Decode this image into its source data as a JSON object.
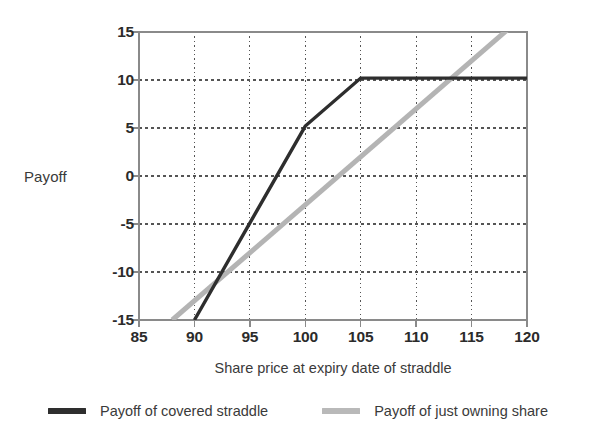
{
  "chart_data": {
    "type": "line",
    "title": "",
    "xlabel": "Share price at expiry date of straddle",
    "ylabel": "Payoff",
    "xlim": [
      85,
      120
    ],
    "ylim": [
      -15,
      15
    ],
    "xticks": [
      85,
      90,
      95,
      100,
      105,
      110,
      115,
      120
    ],
    "yticks": [
      15,
      10,
      5,
      0,
      -5,
      -10,
      -15
    ],
    "xtick_labels": [
      "85",
      "90",
      "95",
      "100",
      "105",
      "110",
      "115",
      "120"
    ],
    "ytick_labels": [
      "15",
      "10",
      "5",
      "0",
      "-5",
      "-10",
      "-15"
    ],
    "grid": true,
    "grid_style": "dotted",
    "legend_position": "bottom",
    "series": [
      {
        "name": "Payoff of covered straddle",
        "color": "#2e2e2e",
        "width": 3.4,
        "x": [
          90,
          100,
          105,
          120
        ],
        "y": [
          -15,
          5.2,
          10.2,
          10.2
        ]
      },
      {
        "name": "Payoff of just owning share",
        "color": "#b4b4b4",
        "width": 5.0,
        "x": [
          88,
          120
        ],
        "y": [
          -15,
          17
        ]
      }
    ]
  },
  "axes": {
    "y_title": "Payoff",
    "x_title": "Share price at expiry date of straddle"
  },
  "legend": {
    "entries": [
      {
        "label": "Payoff of covered straddle",
        "color": "#2e2e2e",
        "thickness": 6
      },
      {
        "label": "Payoff of just owning share",
        "color": "#b9b9b9",
        "thickness": 6
      }
    ]
  },
  "style": {
    "frame_color": "#8a8a8a",
    "grid_color": "#555555",
    "background": "#ffffff",
    "text_color": "#2b2b2b"
  }
}
